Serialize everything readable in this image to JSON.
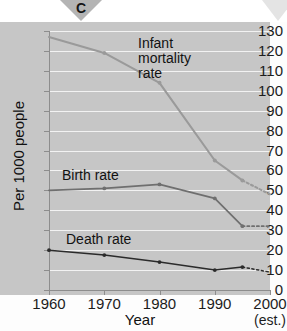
{
  "figure": {
    "panel_letter": "C",
    "background_color": "#c6c6c6",
    "page_color": "#ffffff"
  },
  "axes": {
    "y_title": "Per 1000 people",
    "x_title": "Year",
    "y_ticks": [
      "0",
      "10",
      "20",
      "30",
      "40",
      "50",
      "60",
      "70",
      "80",
      "90",
      "100",
      "110",
      "120",
      "130"
    ],
    "x_ticks": [
      "1960",
      "1970",
      "1980",
      "1990",
      "2000"
    ],
    "x_tick_sub": "(est.)",
    "y_min": 0,
    "y_max": 130,
    "y_step": 10,
    "x_min": 1960,
    "x_max": 2000,
    "x_step": 10
  },
  "labels": {
    "infant_line1": "Infant",
    "infant_line2": "mortality",
    "infant_line3": "rate",
    "birth": "Birth rate",
    "death": "Death rate"
  },
  "chart_data": {
    "type": "line",
    "title": "",
    "subtitle": "",
    "xlabel": "Year",
    "ylabel": "Per 1000 people",
    "xlim": [
      1960,
      2000
    ],
    "ylim": [
      0,
      130
    ],
    "grid": true,
    "grid_orientation": "horizontal",
    "legend": "inline-annotations",
    "annotations": [
      "Infant mortality rate",
      "Birth rate",
      "Death rate"
    ],
    "x": [
      1960,
      1970,
      1980,
      1990,
      1995,
      2000
    ],
    "series": [
      {
        "name": "Infant mortality rate",
        "color": "#9a9a9a",
        "values": [
          127,
          119,
          104,
          65,
          55,
          48
        ],
        "solid_through": 1995,
        "projected_from": 1995,
        "markers_at": [
          1970,
          1980,
          1990,
          1995
        ]
      },
      {
        "name": "Birth rate",
        "color": "#6f6f6f",
        "values": [
          50,
          51,
          53,
          46,
          32,
          32
        ],
        "solid_through": 1995,
        "projected_from": 1995,
        "markers_at": [
          1970,
          1980,
          1990,
          1995
        ]
      },
      {
        "name": "Death rate",
        "color": "#2b2b2b",
        "values": [
          20,
          17.5,
          14,
          10,
          11.5,
          9
        ],
        "solid_through": 1995,
        "projected_from": 1995,
        "markers_at": [
          1960,
          1970,
          1980,
          1990,
          1995
        ]
      }
    ]
  }
}
